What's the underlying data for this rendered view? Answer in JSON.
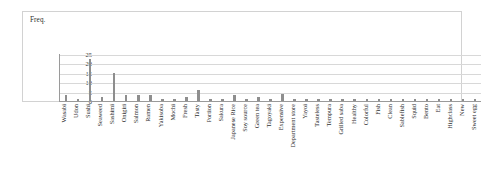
{
  "chart_data": {
    "type": "bar",
    "title": "Freq.",
    "xlabel": "",
    "ylabel": "",
    "ylim": [
      0,
      25
    ],
    "yticks": [
      0,
      5,
      10,
      15,
      20,
      25
    ],
    "grid": true,
    "legend": null,
    "orientation": "vertical",
    "bar_color": "#8e8e8e",
    "categories": [
      "Wasabi",
      "Udon",
      "Sushi",
      "Seaweed",
      "Sashimi",
      "Onigiri",
      "Salmon",
      "Ramen",
      "Yakisoba",
      "Mochi",
      "Fresh",
      "Tasty",
      "Portion",
      "Sakura",
      "Japanese Rice",
      "Soy source",
      "Green tea",
      "Tagoyaki",
      "Expensive",
      "Department store",
      "Yayoi",
      "Tasteless",
      "Tempura",
      "Grilled saba",
      "Healthy",
      "Colorful",
      "Fish",
      "Clean",
      "Sablefish",
      "Squid",
      "Bento",
      "Eat",
      "Highclass",
      "New",
      "Sweet egg"
    ],
    "values": [
      3,
      1,
      23,
      2,
      15,
      3,
      3,
      3,
      1,
      1,
      2,
      6,
      1,
      1,
      3,
      1,
      2,
      1,
      4,
      1,
      1,
      1,
      1,
      1,
      1,
      1,
      1,
      1,
      1,
      1,
      1,
      1,
      1,
      1,
      1
    ]
  }
}
